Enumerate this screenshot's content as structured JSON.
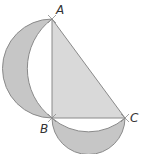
{
  "diagram": {
    "type": "geometry",
    "points": {
      "A": {
        "label": "A",
        "x": 52,
        "y": 19
      },
      "B": {
        "label": "B",
        "x": 52,
        "y": 118
      },
      "C": {
        "label": "C",
        "x": 125,
        "y": 118
      }
    },
    "labels": {
      "A": "A",
      "B": "B",
      "C": "C"
    },
    "colors": {
      "triangle_fill": "#d9d9d9",
      "lune_fill": "#c6c6c6",
      "stroke": "#8a8a8a",
      "label": "#333333"
    }
  }
}
